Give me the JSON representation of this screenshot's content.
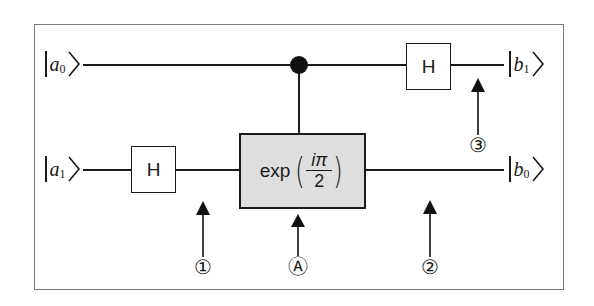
{
  "diagram": {
    "type": "quantum-circuit",
    "inputs": [
      {
        "symbol": "a",
        "subscript": "0",
        "wire": "top"
      },
      {
        "symbol": "a",
        "subscript": "1",
        "wire": "bottom"
      }
    ],
    "outputs": [
      {
        "symbol": "b",
        "subscript": "1",
        "wire": "top"
      },
      {
        "symbol": "b",
        "subscript": "0",
        "wire": "bottom"
      }
    ],
    "gates": [
      {
        "id": "h-bottom",
        "label": "H",
        "wire": "bottom"
      },
      {
        "id": "controlled-exp",
        "label_prefix": "exp",
        "numerator": "iπ",
        "denominator": "2",
        "target_wire": "bottom",
        "control_wire": "top"
      },
      {
        "id": "h-top",
        "label": "H",
        "wire": "top"
      }
    ],
    "markers": [
      {
        "label": "①",
        "position": "after H on bottom wire"
      },
      {
        "label": "Ⓐ",
        "position": "controlled-exp gate"
      },
      {
        "label": "②",
        "position": "after controlled-exp on bottom wire"
      },
      {
        "label": "③",
        "position": "after H on top wire"
      }
    ],
    "colors": {
      "line": "#1a1a1a",
      "exp_fill": "#dedede",
      "frame": "#7a7a7a"
    }
  }
}
